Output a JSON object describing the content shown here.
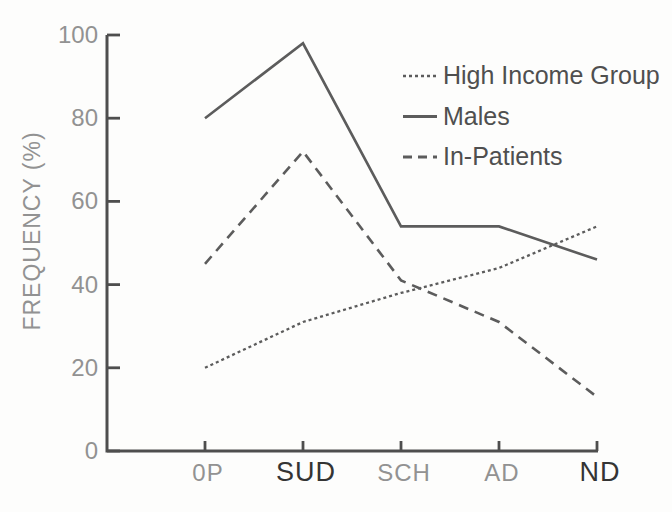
{
  "figure": {
    "background": "#fdfdfc",
    "axis_color": "#4e4e4e",
    "line_color": "#5c5c5c",
    "tick_label_color": "#929292",
    "emphasis_label_color": "#343434",
    "legend_text_color": "#4f4f4f",
    "y_axis_title": "FREQUENCY (%)"
  },
  "chart_data": {
    "type": "line",
    "title": "",
    "xlabel": "",
    "ylabel": "FREQUENCY (%)",
    "categories": [
      "0P",
      "SUD",
      "SCH",
      "AD",
      "ND"
    ],
    "emphasized_categories": [
      "SUD",
      "ND"
    ],
    "ylim": [
      0,
      100
    ],
    "y_ticks": [
      0,
      20,
      40,
      60,
      80,
      100
    ],
    "grid": false,
    "legend_position": "top-right",
    "series": [
      {
        "name": "High Income Group",
        "style": "dotted",
        "values": [
          20,
          31,
          38,
          44,
          54
        ]
      },
      {
        "name": "Males",
        "style": "solid",
        "values": [
          80,
          98,
          54,
          54,
          46
        ]
      },
      {
        "name": "In-Patients",
        "style": "dashed",
        "values": [
          45,
          72,
          41,
          31,
          13
        ]
      }
    ]
  }
}
